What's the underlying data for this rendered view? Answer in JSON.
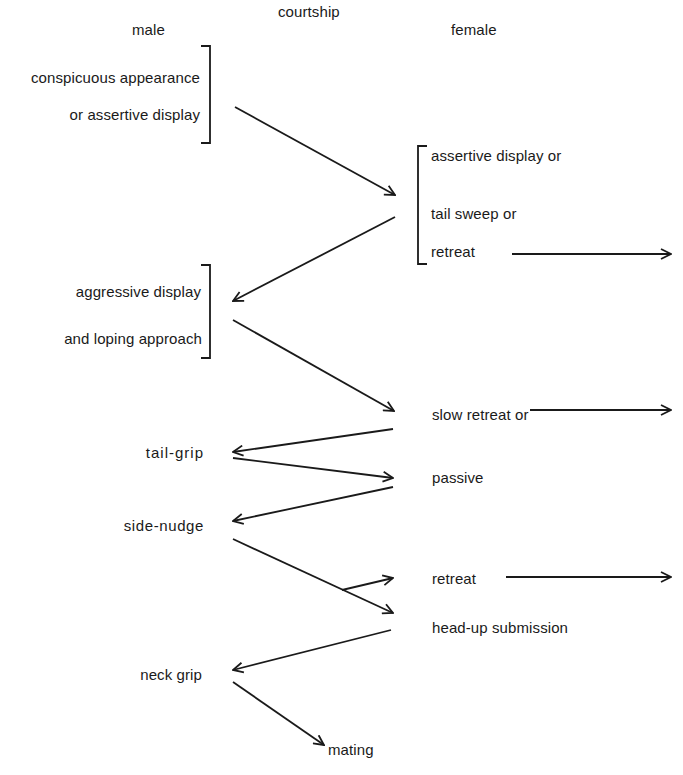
{
  "title": "courtship",
  "columns": {
    "male": "male",
    "female": "female"
  },
  "male_states": [
    {
      "id": "m1",
      "lines": [
        "conspicuous appearance",
        "or assertive display"
      ]
    },
    {
      "id": "m2",
      "lines": [
        "aggressive display",
        "and loping approach"
      ]
    },
    {
      "id": "m3",
      "lines": [
        "tail-grip"
      ]
    },
    {
      "id": "m4",
      "lines": [
        "side-nudge"
      ]
    },
    {
      "id": "m5",
      "lines": [
        "neck grip"
      ]
    }
  ],
  "female_states": [
    {
      "id": "f1",
      "lines": [
        "assertive display or",
        "tail sweep or",
        "retreat"
      ]
    },
    {
      "id": "f2",
      "lines": [
        "slow retreat or"
      ]
    },
    {
      "id": "f3",
      "lines": [
        "passive"
      ]
    },
    {
      "id": "f4",
      "lines": [
        "retreat"
      ]
    },
    {
      "id": "f5",
      "lines": [
        "head-up submission"
      ]
    }
  ],
  "outcome": "mating",
  "transitions": [
    {
      "from": "m1",
      "to": "f1"
    },
    {
      "from": "f1",
      "to": "m2"
    },
    {
      "from": "f1.retreat",
      "to": "exit"
    },
    {
      "from": "m2",
      "to": "f2"
    },
    {
      "from": "f2",
      "to": "exit"
    },
    {
      "from": "f2",
      "to": "m3"
    },
    {
      "from": "m3",
      "to": "f3"
    },
    {
      "from": "f3",
      "to": "m4"
    },
    {
      "from": "m4",
      "to": "f4"
    },
    {
      "from": "m4",
      "to": "f5"
    },
    {
      "from": "f4",
      "to": "exit"
    },
    {
      "from": "f5",
      "to": "m5"
    },
    {
      "from": "m5",
      "to": "mating"
    }
  ],
  "colors": {
    "ink": "#1a1a1a",
    "background": "#ffffff"
  }
}
